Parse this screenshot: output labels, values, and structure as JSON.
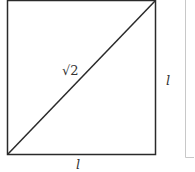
{
  "figure": {
    "shape": "square-with-diagonal",
    "labels": {
      "diagonal": "√2",
      "right_side": "l",
      "bottom_side": "l"
    },
    "colors": {
      "stroke": "#2a2a2a",
      "frame": "#c8c8c8",
      "background": "#ffffff"
    }
  }
}
